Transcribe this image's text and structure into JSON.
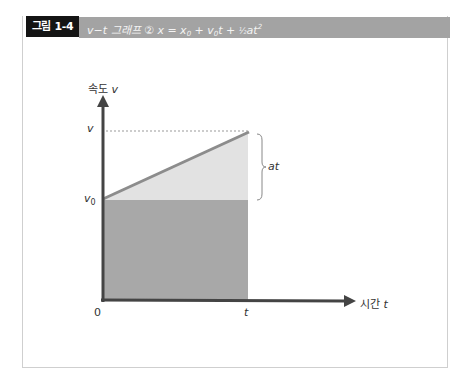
{
  "header": {
    "figure_label": "그림 1-4",
    "title_prefix": "v−t 그래프 ② x = x",
    "title_sub0": "0",
    "title_mid": " + v",
    "title_sub1": "0",
    "title_mid2": "t + ",
    "title_frac": "½",
    "title_end": "at",
    "title_sup": "2"
  },
  "axes": {
    "y_label": "속도 ",
    "y_var": "v",
    "x_label": "시간 ",
    "x_var": "t"
  },
  "ticks": {
    "v_label": "v",
    "v0_label": "v",
    "v0_sub": "0",
    "origin": "0",
    "t_label": "t"
  },
  "annotations": {
    "brace_label": "at"
  },
  "colors": {
    "axis": "#444444",
    "slope_line": "#8c8c8c",
    "dark_fill": "#a8a8a8",
    "light_fill": "#e2e2e2",
    "dotted": "#999999",
    "header_black": "#141414",
    "header_gray": "#a3a3a3"
  }
}
